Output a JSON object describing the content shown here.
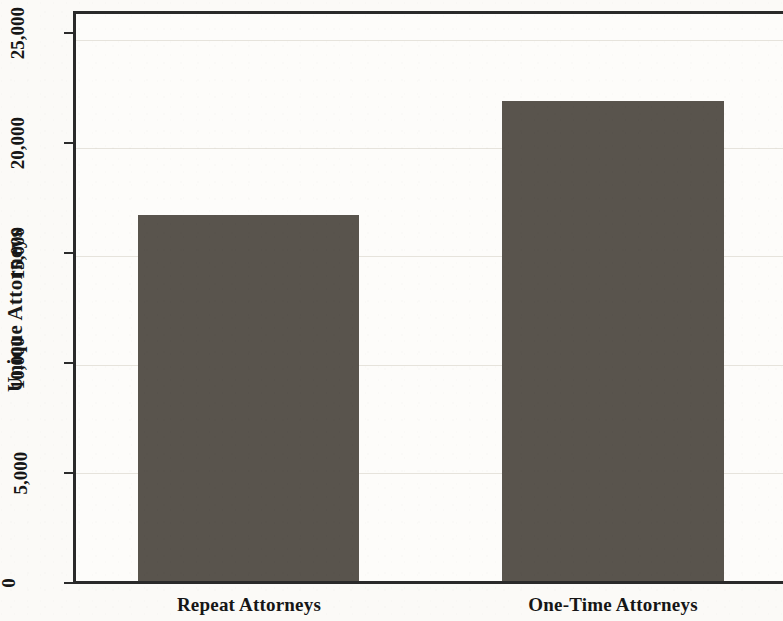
{
  "chart_data": {
    "type": "bar",
    "title": "",
    "subtitle": "",
    "xlabel": "",
    "ylabel": "Unique Attorneys",
    "categories": [
      "Repeat Attorneys",
      "One-Time Attorneys"
    ],
    "values": [
      16900,
      22200
    ],
    "ylim": [
      0,
      26200
    ],
    "yticks": [
      0,
      5000,
      10000,
      15000,
      20000,
      25000
    ],
    "ytick_labels": [
      "0",
      "5,000",
      "10,000",
      "15,000",
      "20,000",
      "25,000"
    ],
    "grid": true,
    "grid_axis": "y",
    "legend": false,
    "legend_position": "none",
    "bar_color": "#59544d",
    "axis_color": "#2a2a2a",
    "gridline_color": "#e6e3dc",
    "background_color": "#fbfaf7",
    "annotations": []
  },
  "axes": {
    "y": {
      "title": "Unique Attorneys",
      "ticks": [
        {
          "label": "25,000",
          "value": 25000
        },
        {
          "label": "20,000",
          "value": 20000
        },
        {
          "label": "15,000",
          "value": 15000
        },
        {
          "label": "10,000",
          "value": 10000
        },
        {
          "label": "5,000",
          "value": 5000
        },
        {
          "label": "0",
          "value": 0
        }
      ]
    },
    "x": {
      "title": "",
      "ticks": [
        {
          "label": "Repeat Attorneys"
        },
        {
          "label": "One-Time Attorneys"
        }
      ]
    }
  },
  "bars": [
    {
      "category": "Repeat Attorneys",
      "value": 16900
    },
    {
      "category": "One-Time Attorneys",
      "value": 22200
    }
  ]
}
